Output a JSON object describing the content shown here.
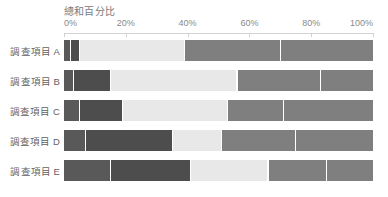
{
  "axis": {
    "title": "總和百分比",
    "ticks": [
      "0%",
      "20%",
      "40%",
      "60%",
      "80%",
      "100%"
    ],
    "tick_values": [
      0,
      20,
      40,
      60,
      80,
      100
    ]
  },
  "colors": {
    "series_1": "#595959",
    "series_2": "#4d4d4d",
    "series_3": "#e8e8e8",
    "series_4": "#7f7f7f",
    "series_5": "#7f7f7f",
    "background": "#ffffff",
    "axis": "#d2d2d2",
    "text": "#7a7a7a"
  },
  "chart_data": {
    "type": "bar",
    "title": "總和百分比",
    "xlabel": "",
    "ylabel": "",
    "xlim": [
      0,
      100
    ],
    "grid": false,
    "legend": "none",
    "orientation": "horizontal",
    "stacked": true,
    "stack_total": 100,
    "categories": [
      "調查項目 A",
      "調查項目 B",
      "調查項目 C",
      "調查項目 D",
      "調查項目 E"
    ],
    "series": [
      {
        "name": "系列 1",
        "color": "#595959",
        "values": [
          2,
          3,
          5,
          7,
          15
        ]
      },
      {
        "name": "系列 2",
        "color": "#4d4d4d",
        "values": [
          3,
          12,
          14,
          28,
          26
        ]
      },
      {
        "name": "系列 3",
        "color": "#e8e8e8",
        "values": [
          34,
          41,
          34,
          16,
          25
        ]
      },
      {
        "name": "系列 4",
        "color": "#7f7f7f",
        "values": [
          31,
          27,
          18,
          24,
          19
        ]
      },
      {
        "name": "系列 5",
        "color": "#7f7f7f",
        "values": [
          30,
          17,
          29,
          25,
          15
        ]
      }
    ]
  }
}
